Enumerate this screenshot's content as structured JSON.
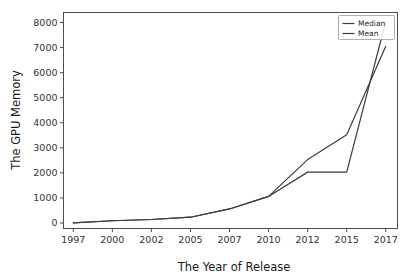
{
  "chart_data": {
    "type": "line",
    "title": "",
    "xlabel": "The Year of Release",
    "ylabel": "The GPU Memory",
    "categories": [
      "1997",
      "2000",
      "2002",
      "2005",
      "2007",
      "2010",
      "2012",
      "2015",
      "2017"
    ],
    "x_tick_labels": [
      "1997",
      "2000",
      "2002",
      "2005",
      "2007",
      "2010",
      "2012",
      "2015",
      "2017"
    ],
    "y_tick_labels": [
      "0",
      "1000",
      "2000",
      "3000",
      "4000",
      "5000",
      "6000",
      "7000",
      "8000"
    ],
    "y_tick_values": [
      0,
      1000,
      2000,
      3000,
      4000,
      5000,
      6000,
      7000,
      8000
    ],
    "ylim": [
      -220,
      8400
    ],
    "xlim": [
      -0.25,
      8.3
    ],
    "grid": false,
    "legend_position": "upper right",
    "series": [
      {
        "name": "Median",
        "color": "#3c3c3c",
        "values": [
          8,
          90,
          140,
          230,
          560,
          1060,
          2030,
          2030,
          8050
        ]
      },
      {
        "name": "Mean",
        "color": "#3c3c3c",
        "values": [
          8,
          90,
          140,
          230,
          560,
          1060,
          2530,
          3520,
          7050
        ]
      }
    ]
  },
  "axes": {
    "x_title": "The Year of Release",
    "y_title": "The GPU Memory"
  },
  "legend": {
    "entries": [
      {
        "label": "Median"
      },
      {
        "label": "Mean"
      }
    ]
  },
  "colors": {
    "line": "#3c3c3c",
    "axis": "#4d4d4d",
    "text": "#262626",
    "background": "#ffffff"
  }
}
